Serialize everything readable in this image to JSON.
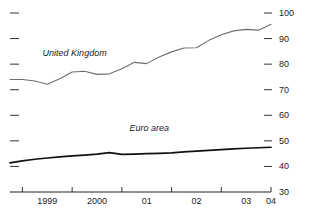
{
  "chart_data": {
    "type": "line",
    "title": "",
    "subtitle": "",
    "xlabel": "",
    "ylabel": "",
    "xlim": [
      1998.75,
      2004.0
    ],
    "ylim": [
      30,
      100
    ],
    "grid": false,
    "y_axis_position": "right",
    "y_ticks": [
      100,
      90,
      80,
      70,
      60,
      50,
      40,
      30
    ],
    "y_tick_labels": [
      "100",
      "90",
      "80",
      "70",
      "60",
      "50",
      "40",
      "30"
    ],
    "x_ticks": [
      1999,
      2000,
      2001,
      2002,
      2003,
      2004
    ],
    "x_tick_labels": [
      "1999",
      "2000",
      "01",
      "02",
      "03",
      "04"
    ],
    "legend_position": "inline-annotation",
    "annotations": [
      {
        "text": "United Kingdom",
        "x": 2000.05,
        "y": 84.5
      },
      {
        "text": "Euro area",
        "x": 2001.55,
        "y": 55.0
      }
    ],
    "series": [
      {
        "name": "United Kingdom",
        "color": "#6e6e6e",
        "width": 1.1,
        "x": [
          1998.75,
          1999.0,
          1999.25,
          1999.5,
          1999.75,
          2000.0,
          2000.25,
          2000.5,
          2000.75,
          2001.0,
          2001.25,
          2001.5,
          2001.75,
          2002.0,
          2002.25,
          2002.5,
          2002.75,
          2003.0,
          2003.25,
          2003.5,
          2003.75,
          2004.0
        ],
        "values": [
          74.0,
          74.0,
          73.4,
          72.1,
          74.3,
          76.9,
          77.2,
          76.0,
          76.2,
          78.2,
          80.7,
          80.2,
          82.8,
          84.8,
          86.3,
          86.4,
          89.3,
          91.5,
          93.0,
          93.6,
          93.3,
          95.6
        ]
      },
      {
        "name": "Euro area",
        "color": "#111111",
        "width": 1.7,
        "x": [
          1998.75,
          1999.0,
          1999.25,
          1999.5,
          1999.75,
          2000.0,
          2000.25,
          2000.5,
          2000.75,
          2001.0,
          2001.25,
          2001.5,
          2001.75,
          2002.0,
          2002.25,
          2002.5,
          2002.75,
          2003.0,
          2003.25,
          2003.5,
          2003.75,
          2004.0
        ],
        "values": [
          41.4,
          42.2,
          42.8,
          43.3,
          43.7,
          44.1,
          44.4,
          44.8,
          45.4,
          44.7,
          44.8,
          45.0,
          45.1,
          45.3,
          45.7,
          46.0,
          46.3,
          46.6,
          46.9,
          47.1,
          47.3,
          47.5
        ]
      }
    ]
  },
  "axis": {
    "line_color": "#222222",
    "tick_color": "#333333"
  }
}
